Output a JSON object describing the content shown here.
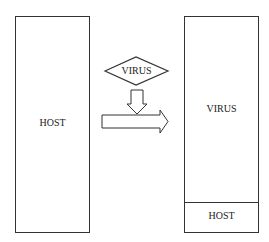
{
  "diagram": {
    "left_box": {
      "label": "HOST"
    },
    "diamond": {
      "label": "VIRUS"
    },
    "right_box": {
      "top_section": {
        "label": "VIRUS"
      },
      "bottom_section": {
        "label": "HOST"
      }
    },
    "arrows": [
      "down-arrow",
      "right-arrow"
    ]
  }
}
